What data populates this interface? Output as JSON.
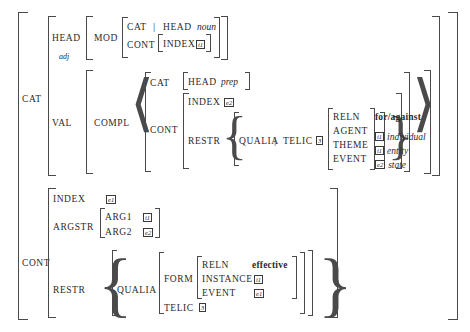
{
  "figure": {
    "kind": "attribute-value-matrix"
  },
  "top": {
    "cat_label": "CAT",
    "cont_label": "CONT"
  },
  "cat": {
    "head_label": "HEAD",
    "head_sort": "adj",
    "mod_label": "MOD",
    "mod": {
      "cat_label": "CAT",
      "pipe": "|",
      "head_label": "HEAD",
      "head_value": "noun",
      "cont_label": "CONT",
      "index_label": "INDEX",
      "index_tag": "i1"
    },
    "val_label": "VAL",
    "compl_label": "COMPL",
    "compl": {
      "cat_label": "CAT",
      "head_label": "HEAD",
      "head_value": "prep",
      "cont_label": "CONT",
      "index_label": "INDEX",
      "index_tag": "e2",
      "restr_label": "RESTR",
      "qualia_label": "QUALIA",
      "pipe": "|",
      "telic_label": "TELIC",
      "telic_tag": "3",
      "telic_value": {
        "reln_label": "RELN",
        "reln_value": "for/against",
        "agent_label": "AGENT",
        "agent_tag": "i1",
        "agent_sort": "individual",
        "theme_label": "THEME",
        "theme_tag": "i1",
        "theme_sort": "entity",
        "event_label": "EVENT",
        "event_tag": "e2",
        "event_sort": "state"
      }
    }
  },
  "cont": {
    "index_label": "INDEX",
    "index_tag": "e1",
    "argstr_label": "ARGSTR",
    "arg1_label": "ARG1",
    "arg1_tag": "i1",
    "arg2_label": "ARG2",
    "arg2_tag": "e2",
    "restr_label": "RESTR",
    "qualia_label": "QUALIA",
    "form_label": "FORM",
    "form": {
      "reln_label": "RELN",
      "reln_value": "effective",
      "instance_label": "INSTANCE",
      "instance_tag": "i1",
      "event_label": "EVENT",
      "event_tag": "e1"
    },
    "telic_label": "TELIC",
    "telic_tag": "3"
  },
  "colors": {
    "ink": "#2a2a2a",
    "rule": "#4a4a4a",
    "background": "#ffffff"
  }
}
